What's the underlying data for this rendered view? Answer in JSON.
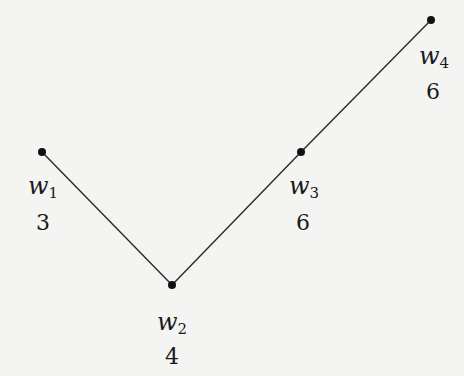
{
  "diagram": {
    "type": "path-graph",
    "colors": {
      "background": "#f4f4f2",
      "edge": "#2a2a2a",
      "node": "#111111",
      "text": "#1a1a1a"
    },
    "nodes": [
      {
        "id": "w1",
        "base": "w",
        "sub": "1",
        "weight": "3",
        "x": 42,
        "y": 152
      },
      {
        "id": "w2",
        "base": "w",
        "sub": "2",
        "weight": "4",
        "x": 172,
        "y": 285
      },
      {
        "id": "w3",
        "base": "w",
        "sub": "3",
        "weight": "6",
        "x": 301,
        "y": 152
      },
      {
        "id": "w4",
        "base": "w",
        "sub": "4",
        "weight": "6",
        "x": 431,
        "y": 20
      }
    ],
    "edges": [
      {
        "from": "w1",
        "to": "w2"
      },
      {
        "from": "w2",
        "to": "w3"
      },
      {
        "from": "w3",
        "to": "w4"
      }
    ]
  }
}
